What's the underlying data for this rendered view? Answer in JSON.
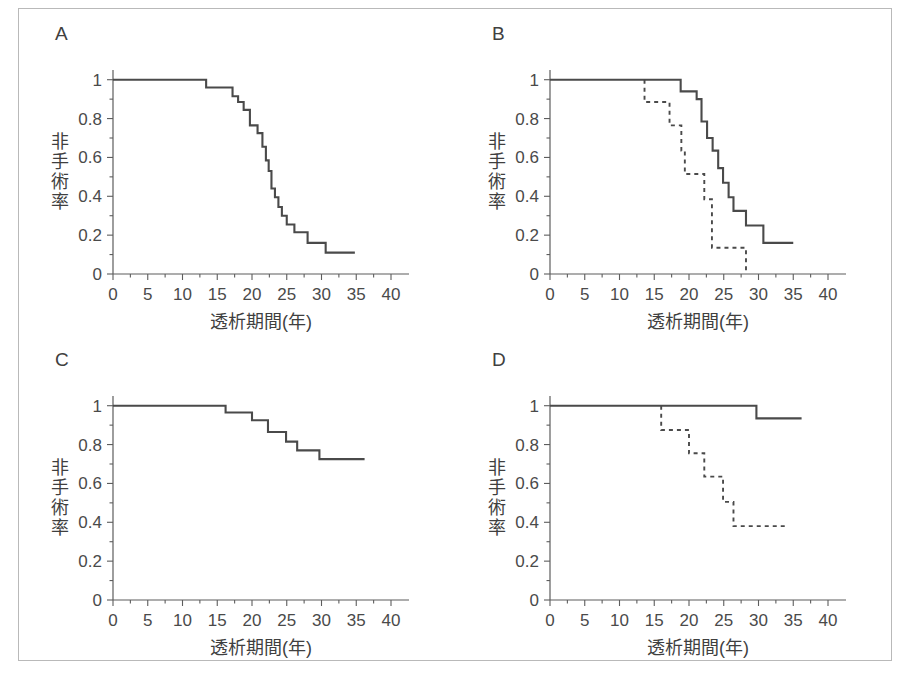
{
  "figure": {
    "border_color": "#b9b9b9",
    "background": "#ffffff",
    "line_color": "#4a4a4a"
  },
  "axes": {
    "x_title": "透析期間(年)",
    "y_title_chars": [
      "非",
      "手",
      "術",
      "率"
    ],
    "x_ticks": [
      "0",
      "5",
      "10",
      "15",
      "20",
      "25",
      "30",
      "35",
      "40"
    ],
    "y_ticks": [
      "0",
      "0.2",
      "0.4",
      "0.6",
      "0.8",
      "1"
    ]
  },
  "panels": [
    {
      "letter": "A"
    },
    {
      "letter": "B"
    },
    {
      "letter": "C"
    },
    {
      "letter": "D"
    }
  ],
  "chart_data": [
    {
      "type": "line",
      "panel": "A",
      "title": "A",
      "xlabel": "透析期間(年)",
      "ylabel": "非手術率",
      "xlim": [
        0,
        40
      ],
      "ylim": [
        0,
        1.05
      ],
      "xticks": [
        0,
        5,
        10,
        15,
        20,
        25,
        30,
        35,
        40
      ],
      "yticks": [
        0,
        0.2,
        0.4,
        0.6,
        0.8,
        1
      ],
      "grid": false,
      "legend": "none",
      "style": "kaplan-meier step",
      "series": [
        {
          "name": "全症例",
          "linestyle": "solid",
          "x": [
            0,
            13.4,
            13.4,
            17.2,
            17.2,
            18.0,
            18.0,
            18.8,
            18.8,
            19.7,
            19.7,
            20.8,
            20.8,
            21.5,
            21.5,
            22.0,
            22.0,
            22.4,
            22.4,
            22.8,
            22.8,
            23.3,
            23.3,
            23.8,
            23.8,
            24.3,
            24.3,
            25.0,
            25.0,
            26.1,
            26.1,
            28.0,
            28.0,
            30.6,
            30.6,
            34.8
          ],
          "y": [
            1.0,
            1.0,
            0.96,
            0.96,
            0.915,
            0.915,
            0.885,
            0.885,
            0.845,
            0.845,
            0.765,
            0.765,
            0.725,
            0.725,
            0.655,
            0.655,
            0.585,
            0.585,
            0.53,
            0.53,
            0.44,
            0.44,
            0.395,
            0.395,
            0.345,
            0.345,
            0.3,
            0.3,
            0.255,
            0.255,
            0.215,
            0.215,
            0.16,
            0.16,
            0.11,
            0.11
          ]
        }
      ]
    },
    {
      "type": "line",
      "panel": "B",
      "title": "B",
      "xlabel": "透析期間(年)",
      "ylabel": "非手術率",
      "xlim": [
        0,
        40
      ],
      "ylim": [
        0,
        1.05
      ],
      "xticks": [
        0,
        5,
        10,
        15,
        20,
        25,
        30,
        35,
        40
      ],
      "yticks": [
        0,
        0.2,
        0.4,
        0.6,
        0.8,
        1
      ],
      "grid": false,
      "legend": "none",
      "style": "kaplan-meier step",
      "series": [
        {
          "name": "実線群",
          "linestyle": "solid",
          "x": [
            0,
            18.8,
            18.8,
            21.1,
            21.1,
            21.8,
            21.8,
            22.6,
            22.6,
            23.4,
            23.4,
            24.2,
            24.2,
            24.9,
            24.9,
            25.7,
            25.7,
            26.4,
            26.4,
            28.2,
            28.2,
            30.7,
            30.7,
            35.0
          ],
          "y": [
            1.0,
            1.0,
            0.94,
            0.94,
            0.9,
            0.9,
            0.785,
            0.785,
            0.7,
            0.7,
            0.635,
            0.635,
            0.545,
            0.545,
            0.47,
            0.47,
            0.395,
            0.395,
            0.325,
            0.325,
            0.25,
            0.25,
            0.16,
            0.16
          ]
        },
        {
          "name": "点線群",
          "linestyle": "dashed",
          "x": [
            13.6,
            13.6,
            17.2,
            17.2,
            18.9,
            18.9,
            19.4,
            19.4,
            22.2,
            22.2,
            23.3,
            23.3,
            28.2,
            28.2
          ],
          "y": [
            1.0,
            0.885,
            0.885,
            0.765,
            0.765,
            0.635,
            0.635,
            0.515,
            0.515,
            0.385,
            0.385,
            0.135,
            0.135,
            0.01
          ]
        }
      ]
    },
    {
      "type": "line",
      "panel": "C",
      "title": "C",
      "xlabel": "透析期間(年)",
      "ylabel": "非手術率",
      "xlim": [
        0,
        40
      ],
      "ylim": [
        0,
        1.05
      ],
      "xticks": [
        0,
        5,
        10,
        15,
        20,
        25,
        30,
        35,
        40
      ],
      "yticks": [
        0,
        0.2,
        0.4,
        0.6,
        0.8,
        1
      ],
      "grid": false,
      "legend": "none",
      "style": "kaplan-meier step",
      "series": [
        {
          "name": "全症例",
          "linestyle": "solid",
          "x": [
            0,
            16.2,
            16.2,
            20.0,
            20.0,
            22.3,
            22.3,
            24.9,
            24.9,
            26.5,
            26.5,
            29.7,
            29.7,
            36.2
          ],
          "y": [
            1.0,
            1.0,
            0.965,
            0.965,
            0.925,
            0.925,
            0.865,
            0.865,
            0.815,
            0.815,
            0.77,
            0.77,
            0.725,
            0.725
          ]
        }
      ]
    },
    {
      "type": "line",
      "panel": "D",
      "title": "D",
      "xlabel": "透析期間(年)",
      "ylabel": "非手術率",
      "xlim": [
        0,
        40
      ],
      "ylim": [
        0,
        1.05
      ],
      "xticks": [
        0,
        5,
        10,
        15,
        20,
        25,
        30,
        35,
        40
      ],
      "yticks": [
        0,
        0.2,
        0.4,
        0.6,
        0.8,
        1
      ],
      "grid": false,
      "legend": "none",
      "style": "kaplan-meier step",
      "series": [
        {
          "name": "実線群",
          "linestyle": "solid",
          "x": [
            0,
            29.7,
            29.7,
            36.2
          ],
          "y": [
            1.0,
            1.0,
            0.935,
            0.935
          ]
        },
        {
          "name": "点線群",
          "linestyle": "dashed",
          "x": [
            16.0,
            16.0,
            20.0,
            20.0,
            22.2,
            22.2,
            24.9,
            24.9,
            26.4,
            26.4,
            34.0
          ],
          "y": [
            1.0,
            0.875,
            0.875,
            0.755,
            0.755,
            0.635,
            0.635,
            0.505,
            0.505,
            0.38,
            0.38,
            0.38
          ]
        }
      ]
    }
  ]
}
